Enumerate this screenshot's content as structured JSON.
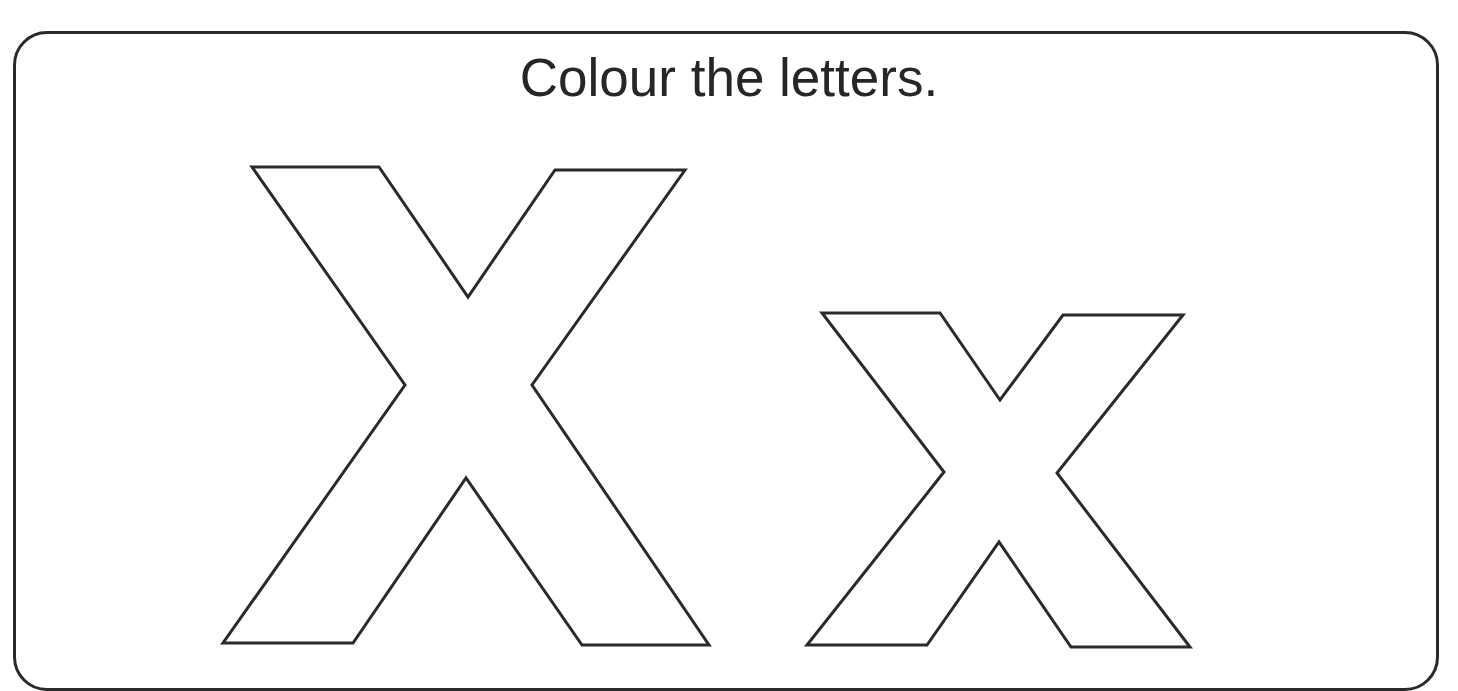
{
  "worksheet": {
    "instruction": "Colour the letters.",
    "letters": [
      {
        "name": "uppercase-x",
        "char": "X",
        "style": "outline"
      },
      {
        "name": "lowercase-x",
        "char": "x",
        "style": "outline"
      }
    ],
    "colors": {
      "outline": "#2a2a2a",
      "text": "#262626",
      "background": "#ffffff"
    }
  }
}
